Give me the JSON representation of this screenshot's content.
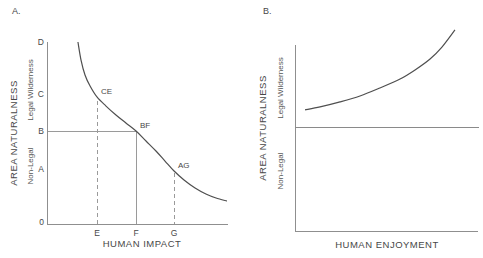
{
  "figure": {
    "background": "#ffffff",
    "colors": {
      "curve": "#4f4f4f",
      "axis": "#8f8f8f",
      "guide": "#9a9a9a",
      "text": "#474747"
    }
  },
  "chart_data": [
    {
      "type": "line",
      "panel_label": "A.",
      "title": "",
      "xlabel": "HUMAN IMPACT",
      "ylabel": "AREA NATURALNESS",
      "ylabel_zones": {
        "upper": "Legal Wilderness",
        "lower": "Non-Legal"
      },
      "y_tick_labels": [
        "D",
        "C",
        "B",
        "A",
        "0"
      ],
      "y_tick_positions": [
        100,
        72,
        50.5,
        30,
        0
      ],
      "x_tick_labels": [
        "E",
        "F",
        "G"
      ],
      "x_tick_positions": [
        27.6,
        49.2,
        70.2
      ],
      "axis_range": {
        "x": [
          0,
          100
        ],
        "y": [
          0,
          100
        ]
      },
      "grid": false,
      "series": [
        {
          "name": "naturalness_vs_impact",
          "style": "solid",
          "points": [
            [
              17.1,
              100
            ],
            [
              18.8,
              90.1
            ],
            [
              21.0,
              81.9
            ],
            [
              23.8,
              75.8
            ],
            [
              27.6,
              69.8
            ],
            [
              32.6,
              64.8
            ],
            [
              38.1,
              59.9
            ],
            [
              43.6,
              55.5
            ],
            [
              49.2,
              51.1
            ],
            [
              54.7,
              45.6
            ],
            [
              60.2,
              40.1
            ],
            [
              65.2,
              34.6
            ],
            [
              70.2,
              29.1
            ],
            [
              75.7,
              24.2
            ],
            [
              81.8,
              19.8
            ],
            [
              87.8,
              16.5
            ],
            [
              93.4,
              14.3
            ],
            [
              99.4,
              12.6
            ]
          ]
        }
      ],
      "annotations": [
        {
          "label": "CE",
          "x": 27.6,
          "y": 69.8
        },
        {
          "label": "BF",
          "x": 49.2,
          "y": 51.1
        },
        {
          "label": "AG",
          "x": 70.2,
          "y": 29.1
        }
      ],
      "guides": [
        {
          "at_label": "E",
          "orientation": "vertical",
          "style": "dashed"
        },
        {
          "at_label": "F",
          "orientation": "vertical",
          "style": "solid"
        },
        {
          "at_label": "G",
          "orientation": "vertical",
          "style": "dashed"
        },
        {
          "at_label": "B",
          "orientation": "horizontal",
          "style": "solid"
        }
      ]
    },
    {
      "type": "line",
      "panel_label": "B.",
      "title": "",
      "xlabel": "HUMAN ENJOYMENT",
      "ylabel": "AREA NATURALNESS",
      "ylabel_zones": {
        "upper": "Legal Wilderness",
        "lower": "Non-Legal"
      },
      "y_tick_labels": [],
      "x_tick_labels": [],
      "axis_range": {
        "x": [
          0,
          100
        ],
        "y": [
          0,
          100
        ]
      },
      "grid": false,
      "series": [
        {
          "name": "naturalness_vs_enjoyment",
          "style": "solid",
          "points": [
            [
              5.5,
              65.1
            ],
            [
              13.7,
              66.7
            ],
            [
              24.6,
              69.4
            ],
            [
              35.5,
              72.6
            ],
            [
              46.4,
              76.9
            ],
            [
              57.4,
              81.7
            ],
            [
              65.6,
              86.6
            ],
            [
              73.8,
              92.5
            ],
            [
              80.3,
              98.9
            ],
            [
              87.4,
              108.1
            ]
          ]
        },
        {
          "name": "legal_wilderness_threshold",
          "style": "solid-horizontal-line",
          "points": [
            [
              0,
              55.4
            ],
            [
              100.5,
              55.4
            ]
          ]
        }
      ],
      "annotations": [],
      "guides": []
    }
  ]
}
